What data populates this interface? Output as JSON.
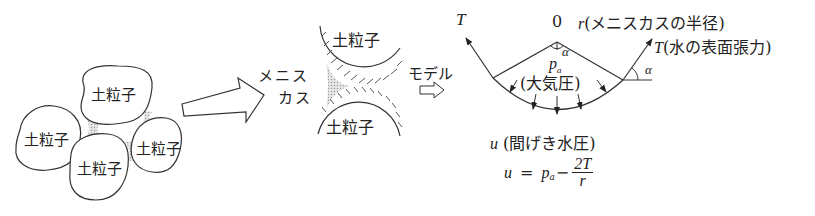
{
  "figure": {
    "type": "meniscus-capillary-diagram",
    "colors": {
      "line": "#333333",
      "meniscus_fill": "#b8b8b8",
      "background": "#ffffff"
    }
  },
  "left_panel": {
    "grains": [
      {
        "label": "土粒子"
      },
      {
        "label": "土粒子"
      },
      {
        "label": "土粒子"
      },
      {
        "label": "土粒子"
      }
    ]
  },
  "middle_panel": {
    "meniscus_label_line1": "メニス",
    "meniscus_label_line2": "カス",
    "grain_top_label": "土粒子",
    "grain_bottom_label": "土粒子"
  },
  "model_arrow": {
    "label": "モデル",
    "glyph": "⇨"
  },
  "right_panel": {
    "tension_left": "T",
    "center_label": "0",
    "radius_label": "r",
    "radius_desc": "(メニスカスの半径)",
    "tension_right": "T",
    "tension_desc": "(水の表面張力)",
    "alpha_top": "α",
    "alpha_right": "α",
    "pa_symbol": "p",
    "pa_subscript": "a",
    "atm_label": "(大気圧)",
    "pore_symbol": "u",
    "pore_label": "(間げき水圧)",
    "equation": {
      "lhs": "u",
      "equals": "=",
      "pa": "p",
      "pa_sub": "a",
      "minus": "−",
      "numerator": "2T",
      "denominator": "r"
    }
  }
}
